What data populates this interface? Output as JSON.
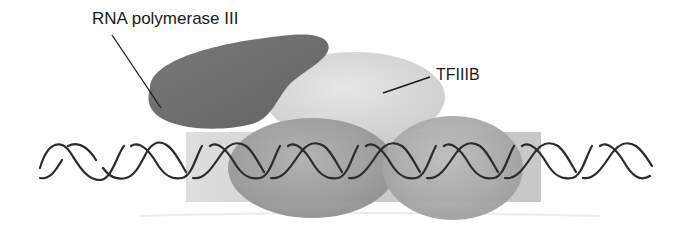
{
  "diagram": {
    "type": "molecular-schematic",
    "labels": {
      "rna_pol_iii": "RNA polymerase III",
      "tfiiib": "TFIIIB"
    },
    "components": [
      {
        "name": "RNA polymerase III",
        "shape": "kidney-blob",
        "color": "#6e6e6e"
      },
      {
        "name": "TFIIIB",
        "shape": "ellipse",
        "color": "#d9d9d9"
      },
      {
        "name": "TFIIIC-left-subunit",
        "shape": "ellipse",
        "color": "#a3a3a3"
      },
      {
        "name": "TFIIIC-right-subunit",
        "shape": "ellipse",
        "color": "#b0b0b0"
      },
      {
        "name": "promoter-region",
        "shape": "rectangle",
        "color": "#cfcfcf"
      },
      {
        "name": "DNA",
        "shape": "double-helix",
        "color": "#2b2b2b"
      }
    ],
    "colors": {
      "background": "#ffffff",
      "pol_iii": "#6e6e6e",
      "tfiiib": "#dcdcdc",
      "ellipse_left": "#a0a0a0",
      "ellipse_right": "#adadad",
      "rectangle": "#cccccc",
      "dna": "#2b2b2b",
      "text": "#1a1a1a"
    }
  }
}
